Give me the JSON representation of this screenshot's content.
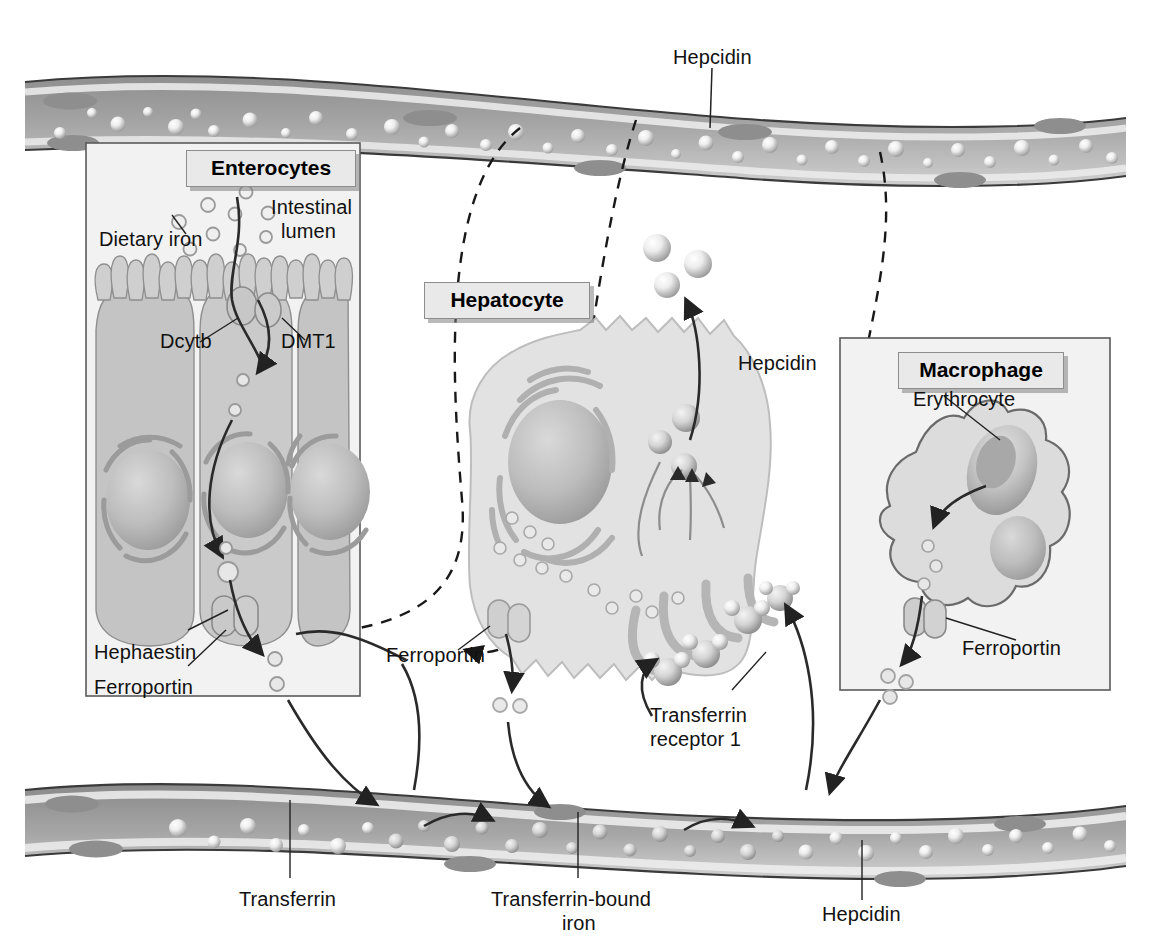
{
  "figure": {
    "background": "#ffffff",
    "plasma_color": "#9a9a9a",
    "cell_color": "#d8d8d8",
    "ink_color": "#222222"
  },
  "panels": [
    {
      "id": "enterocytes",
      "label": "Enterocytes"
    },
    {
      "id": "hepatocyte",
      "label": "Hepatocyte"
    },
    {
      "id": "macrophage",
      "label": "Macrophage"
    }
  ],
  "labels": {
    "hepcidin_top": "Hepcidin",
    "dietary_iron": "Dietary iron",
    "intestinal_lumen_l1": "Intestinal",
    "intestinal_lumen_l2": "lumen",
    "dcytb": "Dcytb",
    "dmt1": "DMT1",
    "hephaestin": "Hephaestin",
    "ferroportin_enterocyte": "Ferroportin",
    "ferroportin_hepatocyte": "Ferroportin",
    "ferroportin_macrophage": "Ferroportin",
    "hepcidin_hepatocyte": "Hepcidin",
    "erythrocyte": "Erythrocyte",
    "transferrin_receptor_l1": "Transferrin",
    "transferrin_receptor_l2": "receptor 1",
    "transferrin": "Transferrin",
    "transferrin_bound_iron_l1": "Transferrin-bound",
    "transferrin_bound_iron_l2": "iron",
    "hepcidin_bottom": "Hepcidin"
  },
  "icons": {
    "iron_atom": "iron-particle-icon",
    "transferrin_complex": "transferrin-iron-complex-icon",
    "hepcidin_sphere": "hepcidin-molecule-icon",
    "ferroportin_channel": "ferroportin-channel-icon",
    "dmt1_channel": "dmt1-transporter-icon",
    "nucleus": "cell-nucleus-icon",
    "microvilli": "microvilli-icon",
    "dashed_inhibition": "hepcidin-inhibition-arrow-icon"
  }
}
